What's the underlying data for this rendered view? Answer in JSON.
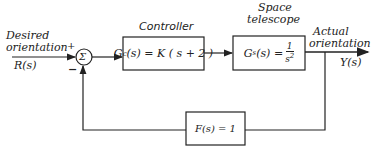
{
  "diagram": {
    "type": "feedback-control-block-diagram",
    "input": {
      "label_line1": "Desired",
      "label_line2": "orientation",
      "signal": "R(s)",
      "plus_sign": "+"
    },
    "summing_junction": {
      "symbol": "Σ",
      "feedback_sign": "−"
    },
    "controller": {
      "title": "Controller",
      "g_symbol": "G",
      "g_sub": "c",
      "expr": "(s) = K ( s + 2 )"
    },
    "plant": {
      "title_line1": "Space",
      "title_line2": "telescope",
      "g_symbol": "G",
      "g_sub": "s",
      "expr": "(s) =",
      "numerator": "1",
      "denominator": "s",
      "denominator_power": "2"
    },
    "output": {
      "label_line1": "Actual",
      "label_line2": "orientation",
      "signal": "Y(s)"
    },
    "feedback": {
      "expr": "F(s) = 1"
    },
    "colors": {
      "line": "#222222",
      "background": "#ffffff"
    }
  }
}
